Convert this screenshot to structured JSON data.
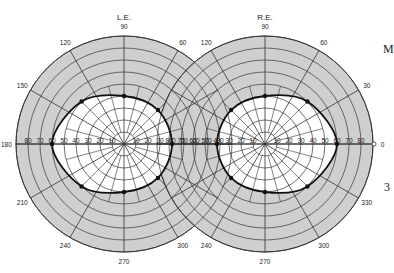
{
  "figure": {
    "edge_fragments": [
      {
        "text": "M",
        "x": 383,
        "y": 52
      },
      {
        "text": "3",
        "x": 384,
        "y": 190
      }
    ]
  },
  "colors": {
    "outer_band": "#cfcfcf",
    "inner_field": "#ffffff",
    "grid": "#333333",
    "isopter": "#111111"
  },
  "chart_data": {
    "type": "polar",
    "geometry": {
      "ring_step_deg": 10,
      "max_deg": 90,
      "meridian_step_deg": 30,
      "inner_meridian_step_deg": 15
    },
    "scale_labels": [
      10,
      20,
      30,
      40,
      50,
      60,
      70,
      80
    ],
    "charts": [
      {
        "eye": "L.E.",
        "center": [
          124,
          144
        ],
        "radius_px": 108,
        "meridian_labels": [
          {
            "angle": 90,
            "text": "90"
          },
          {
            "angle": 120,
            "text": "120"
          },
          {
            "angle": 60,
            "text": "60"
          },
          {
            "angle": 150,
            "text": "150"
          },
          {
            "angle": 180,
            "text": "180"
          },
          {
            "angle": 210,
            "text": "210"
          },
          {
            "angle": 240,
            "text": "240"
          },
          {
            "angle": 270,
            "text": "270"
          },
          {
            "angle": 300,
            "text": "300"
          }
        ],
        "isopter_points": [
          {
            "angle": 0,
            "deg": 40
          },
          {
            "angle": 45,
            "deg": 40
          },
          {
            "angle": 90,
            "deg": 40
          },
          {
            "angle": 135,
            "deg": 50
          },
          {
            "angle": 180,
            "deg": 60
          },
          {
            "angle": 225,
            "deg": 50
          },
          {
            "angle": 270,
            "deg": 40
          },
          {
            "angle": 315,
            "deg": 40
          }
        ]
      },
      {
        "eye": "R.E.",
        "center": [
          265,
          144
        ],
        "radius_px": 108,
        "meridian_labels": [
          {
            "angle": 90,
            "text": "90"
          },
          {
            "angle": 120,
            "text": "120"
          },
          {
            "angle": 60,
            "text": "60"
          },
          {
            "angle": 30,
            "text": "30"
          },
          {
            "angle": 0,
            "text": "0"
          },
          {
            "angle": 330,
            "text": "330"
          },
          {
            "angle": 300,
            "text": "300"
          },
          {
            "angle": 270,
            "text": "270"
          },
          {
            "angle": 240,
            "text": "240"
          }
        ],
        "isopter_points": [
          {
            "angle": 0,
            "deg": 60
          },
          {
            "angle": 45,
            "deg": 50
          },
          {
            "angle": 90,
            "deg": 40
          },
          {
            "angle": 135,
            "deg": 40
          },
          {
            "angle": 180,
            "deg": 40
          },
          {
            "angle": 225,
            "deg": 40
          },
          {
            "angle": 270,
            "deg": 40
          },
          {
            "angle": 315,
            "deg": 50
          }
        ]
      }
    ]
  }
}
